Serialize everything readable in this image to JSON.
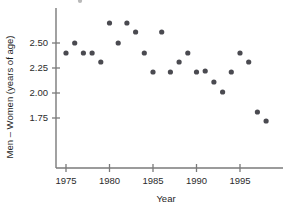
{
  "chart_data": {
    "type": "scatter",
    "title": "",
    "xlabel": "Year",
    "ylabel": "Men – Women (years of age)",
    "xlim": [
      1974.2,
      1998.6
    ],
    "ylim": [
      1.66,
      2.78
    ],
    "grid": false,
    "legend": null,
    "xticks": [
      1975,
      1980,
      1985,
      1990,
      1995
    ],
    "xtick_labels": [
      "1975",
      "1980",
      "1985",
      "1990",
      "1995"
    ],
    "yticks": [
      1.75,
      2.0,
      2.25,
      2.5
    ],
    "ytick_labels": [
      "1.75",
      "2.00",
      "2.25",
      "2.50"
    ],
    "marker": "filled-circle",
    "marker_color": "#4a4a50",
    "x": [
      1975,
      1976,
      1977,
      1978,
      1979,
      1980,
      1981,
      1982,
      1983,
      1984,
      1985,
      1986,
      1987,
      1988,
      1989,
      1990,
      1991,
      1992,
      1993,
      1994,
      1995,
      1996,
      1997,
      1998
    ],
    "y": [
      2.4,
      2.5,
      2.4,
      2.4,
      2.31,
      2.7,
      2.5,
      2.7,
      2.61,
      2.4,
      2.21,
      2.61,
      2.21,
      2.31,
      2.4,
      2.21,
      2.22,
      2.11,
      2.01,
      2.21,
      2.4,
      2.31,
      1.81,
      1.72
    ],
    "points": [
      {
        "x": 1975,
        "y": 2.4
      },
      {
        "x": 1976,
        "y": 2.5
      },
      {
        "x": 1977,
        "y": 2.4
      },
      {
        "x": 1978,
        "y": 2.4
      },
      {
        "x": 1979,
        "y": 2.31
      },
      {
        "x": 1980,
        "y": 2.7
      },
      {
        "x": 1981,
        "y": 2.5
      },
      {
        "x": 1982,
        "y": 2.7
      },
      {
        "x": 1983,
        "y": 2.61
      },
      {
        "x": 1984,
        "y": 2.4
      },
      {
        "x": 1985,
        "y": 2.21
      },
      {
        "x": 1986,
        "y": 2.61
      },
      {
        "x": 1987,
        "y": 2.21
      },
      {
        "x": 1988,
        "y": 2.31
      },
      {
        "x": 1989,
        "y": 2.4
      },
      {
        "x": 1990,
        "y": 2.21
      },
      {
        "x": 1991,
        "y": 2.22
      },
      {
        "x": 1992,
        "y": 2.11
      },
      {
        "x": 1993,
        "y": 2.01
      },
      {
        "x": 1994,
        "y": 2.21
      },
      {
        "x": 1995,
        "y": 2.4
      },
      {
        "x": 1996,
        "y": 2.31
      },
      {
        "x": 1997,
        "y": 1.81
      },
      {
        "x": 1998,
        "y": 1.72
      }
    ]
  },
  "axes": {
    "x_axis_label": "Year",
    "y_axis_label": "Men – Women (years of age)"
  }
}
